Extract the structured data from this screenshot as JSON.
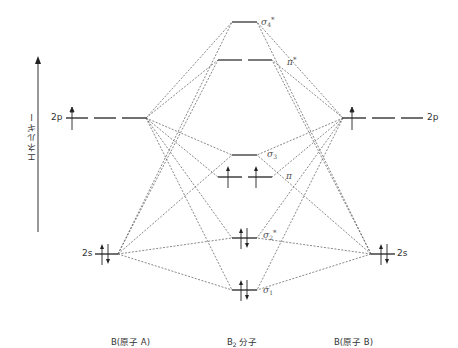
{
  "diagram": {
    "type": "molecular-orbital-energy-diagram",
    "axis": {
      "label": "エネルギー",
      "direction": "up"
    },
    "atoms": {
      "left": {
        "name": "B(原子 A)",
        "orbitals": [
          {
            "label": "2p",
            "electrons": "↑",
            "count": 1
          },
          {
            "label": "2s",
            "electrons": "↑↓",
            "count": 2
          }
        ]
      },
      "right": {
        "name": "B(原子 B)",
        "orbitals": [
          {
            "label": "2p",
            "electrons": "↑",
            "count": 1
          },
          {
            "label": "2s",
            "electrons": "↑↓",
            "count": 2
          }
        ]
      }
    },
    "molecule": {
      "name_base": "B",
      "name_sub": "2",
      "name_suffix": " 分子",
      "orbitals": [
        {
          "symbol": "σ",
          "sub": "4",
          "sup": "*",
          "electrons": 0
        },
        {
          "symbol": "π",
          "sub": "",
          "sup": "*",
          "electrons": 0
        },
        {
          "symbol": "σ",
          "sub": "3",
          "sup": "",
          "electrons": 0
        },
        {
          "symbol": "π",
          "sub": "",
          "sup": "",
          "electrons": 2
        },
        {
          "symbol": "σ",
          "sub": "2",
          "sup": "*",
          "electrons": 2
        },
        {
          "symbol": "σ",
          "sub": "1",
          "sup": "",
          "electrons": 2
        }
      ]
    }
  }
}
